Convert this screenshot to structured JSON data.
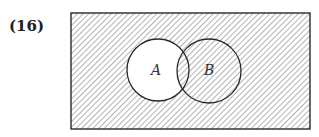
{
  "problem": {
    "number": "(16)"
  },
  "diagram": {
    "type": "venn",
    "universe": {
      "x": 71,
      "y": 13,
      "width": 239,
      "height": 116,
      "shaded": true
    },
    "sets": [
      {
        "label": "A",
        "cx": 158,
        "cy": 70,
        "r": 31,
        "shaded": false
      },
      {
        "label": "B",
        "cx": 209,
        "cy": 71,
        "r": 32,
        "shaded": true
      }
    ],
    "intersection_shaded": true,
    "shaded_region": "complement of (A minus B)",
    "colors": {
      "stroke": "#2a2a2a",
      "hatch": "#8a8a8a",
      "background": "#ffffff"
    }
  }
}
